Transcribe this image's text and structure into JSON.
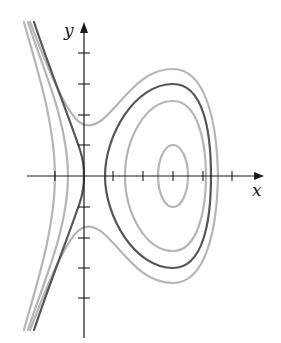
{
  "figure": {
    "type": "phase-portrait",
    "axes": {
      "x_label": "x",
      "y_label": "y",
      "x_ticks_count_neg": 1,
      "x_ticks_count_pos": 5,
      "y_ticks_count_pos": 4,
      "y_ticks_count_neg": 4
    },
    "colors": {
      "separatrix": "#555555",
      "level_curve": "#b5b5b5",
      "axis": "#1a1a1a"
    },
    "curves": [
      {
        "name": "inner-closed-orbit",
        "style": "level_curve"
      },
      {
        "name": "middle-closed-orbit",
        "style": "level_curve"
      },
      {
        "name": "separatrix-loop",
        "style": "separatrix"
      },
      {
        "name": "separatrix-left-branch",
        "style": "separatrix"
      },
      {
        "name": "outer-open-orbit",
        "style": "level_curve"
      },
      {
        "name": "left-open-orbit-near",
        "style": "level_curve"
      },
      {
        "name": "left-open-orbit-far",
        "style": "level_curve"
      }
    ]
  }
}
